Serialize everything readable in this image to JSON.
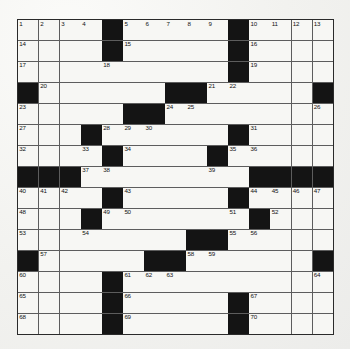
{
  "puzzle": {
    "title": "Crossword Grid",
    "rows": 15,
    "columns": 15,
    "colors": {
      "page_background": "#f4f4f1",
      "cell_fill": "#f7f7f4",
      "block_fill": "#141414",
      "grid_line": "#5d5d5d",
      "border": "#2a2a2a",
      "number_text": "#111111"
    },
    "legend": {
      "block_symbol": "#",
      "open_symbol": "."
    },
    "layout": [
      "....#.....#....",
      "....#.....#....",
      "..........#....",
      "#......##......#",
      ".....##........#",
      "...#.......#...",
      "...#....#......",
      "###............####",
      "...#.#....#....",
      "...#......#.#..",
      "...........#...",
      "#.....##.......#",
      ".....#.........",
      "....#.....#....",
      "....#.....#...."
    ],
    "block_cells": [
      [
        0,
        4
      ],
      [
        0,
        10
      ],
      [
        1,
        4
      ],
      [
        1,
        10
      ],
      [
        2,
        10
      ],
      [
        3,
        0
      ],
      [
        3,
        7
      ],
      [
        3,
        8
      ],
      [
        3,
        14
      ],
      [
        4,
        5
      ],
      [
        4,
        6
      ],
      [
        5,
        3
      ],
      [
        5,
        10
      ],
      [
        6,
        4
      ],
      [
        6,
        9
      ],
      [
        7,
        0
      ],
      [
        7,
        1
      ],
      [
        7,
        2
      ],
      [
        7,
        11
      ],
      [
        7,
        12
      ],
      [
        7,
        13
      ],
      [
        7,
        14
      ],
      [
        8,
        4
      ],
      [
        8,
        10
      ],
      [
        9,
        3
      ],
      [
        9,
        11
      ],
      [
        10,
        8
      ],
      [
        10,
        9
      ],
      [
        11,
        0
      ],
      [
        11,
        6
      ],
      [
        11,
        7
      ],
      [
        11,
        14
      ],
      [
        12,
        4
      ],
      [
        13,
        4
      ],
      [
        13,
        10
      ],
      [
        14,
        4
      ],
      [
        14,
        10
      ]
    ],
    "numbered_cells": [
      {
        "n": 1,
        "row": 0,
        "col": 0
      },
      {
        "n": 2,
        "row": 0,
        "col": 1
      },
      {
        "n": 3,
        "row": 0,
        "col": 2
      },
      {
        "n": 4,
        "row": 0,
        "col": 3
      },
      {
        "n": 5,
        "row": 0,
        "col": 5
      },
      {
        "n": 6,
        "row": 0,
        "col": 6
      },
      {
        "n": 7,
        "row": 0,
        "col": 7
      },
      {
        "n": 8,
        "row": 0,
        "col": 8
      },
      {
        "n": 9,
        "row": 0,
        "col": 9
      },
      {
        "n": 10,
        "row": 0,
        "col": 11
      },
      {
        "n": 11,
        "row": 0,
        "col": 12
      },
      {
        "n": 12,
        "row": 0,
        "col": 13
      },
      {
        "n": 13,
        "row": 0,
        "col": 14
      },
      {
        "n": 14,
        "row": 1,
        "col": 0
      },
      {
        "n": 15,
        "row": 1,
        "col": 5
      },
      {
        "n": 16,
        "row": 1,
        "col": 11
      },
      {
        "n": 17,
        "row": 2,
        "col": 0
      },
      {
        "n": 18,
        "row": 2,
        "col": 4
      },
      {
        "n": 19,
        "row": 2,
        "col": 11
      },
      {
        "n": 20,
        "row": 3,
        "col": 1
      },
      {
        "n": 21,
        "row": 3,
        "col": 9
      },
      {
        "n": 22,
        "row": 3,
        "col": 10
      },
      {
        "n": 23,
        "row": 4,
        "col": 0
      },
      {
        "n": 24,
        "row": 4,
        "col": 7
      },
      {
        "n": 25,
        "row": 4,
        "col": 8
      },
      {
        "n": 26,
        "row": 4,
        "col": 14
      },
      {
        "n": 27,
        "row": 5,
        "col": 0
      },
      {
        "n": 28,
        "row": 5,
        "col": 4
      },
      {
        "n": 29,
        "row": 5,
        "col": 5
      },
      {
        "n": 30,
        "row": 5,
        "col": 6
      },
      {
        "n": 31,
        "row": 5,
        "col": 11
      },
      {
        "n": 32,
        "row": 6,
        "col": 0
      },
      {
        "n": 33,
        "row": 6,
        "col": 3
      },
      {
        "n": 34,
        "row": 6,
        "col": 5
      },
      {
        "n": 35,
        "row": 6,
        "col": 10
      },
      {
        "n": 36,
        "row": 6,
        "col": 11
      },
      {
        "n": 37,
        "row": 7,
        "col": 3
      },
      {
        "n": 38,
        "row": 7,
        "col": 4
      },
      {
        "n": 39,
        "row": 7,
        "col": 9
      },
      {
        "n": 40,
        "row": 8,
        "col": 0
      },
      {
        "n": 41,
        "row": 8,
        "col": 1
      },
      {
        "n": 42,
        "row": 8,
        "col": 2
      },
      {
        "n": 43,
        "row": 8,
        "col": 5
      },
      {
        "n": 44,
        "row": 8,
        "col": 11
      },
      {
        "n": 45,
        "row": 8,
        "col": 12
      },
      {
        "n": 46,
        "row": 8,
        "col": 13
      },
      {
        "n": 47,
        "row": 8,
        "col": 14
      },
      {
        "n": 48,
        "row": 9,
        "col": 0
      },
      {
        "n": 49,
        "row": 9,
        "col": 4
      },
      {
        "n": 50,
        "row": 9,
        "col": 5
      },
      {
        "n": 51,
        "row": 9,
        "col": 10
      },
      {
        "n": 52,
        "row": 9,
        "col": 12
      },
      {
        "n": 53,
        "row": 10,
        "col": 0
      },
      {
        "n": 54,
        "row": 10,
        "col": 3
      },
      {
        "n": 55,
        "row": 10,
        "col": 10
      },
      {
        "n": 56,
        "row": 10,
        "col": 11
      },
      {
        "n": 57,
        "row": 11,
        "col": 1
      },
      {
        "n": 58,
        "row": 11,
        "col": 8
      },
      {
        "n": 59,
        "row": 11,
        "col": 9
      },
      {
        "n": 60,
        "row": 12,
        "col": 0
      },
      {
        "n": 61,
        "row": 12,
        "col": 5
      },
      {
        "n": 62,
        "row": 12,
        "col": 6
      },
      {
        "n": 63,
        "row": 12,
        "col": 7
      },
      {
        "n": 64,
        "row": 12,
        "col": 14
      },
      {
        "n": 65,
        "row": 13,
        "col": 0
      },
      {
        "n": 66,
        "row": 13,
        "col": 5
      },
      {
        "n": 67,
        "row": 13,
        "col": 11
      },
      {
        "n": 68,
        "row": 14,
        "col": 0
      },
      {
        "n": 69,
        "row": 14,
        "col": 5
      },
      {
        "n": 70,
        "row": 14,
        "col": 11
      }
    ],
    "filled_letters": []
  }
}
